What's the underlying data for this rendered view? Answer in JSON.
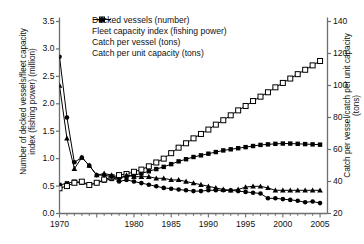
{
  "chart_data": {
    "type": "line",
    "title": "",
    "subtitle": "",
    "xlabel": "",
    "ylabel": "Number of decked vessels/fleet capacity\nindex (fishing power) (million)",
    "ylabel_right": "Catch per vessel/catch per unit capacity\n(tons)",
    "xlim": [
      1970,
      2006
    ],
    "ylim": [
      0.0,
      3.5
    ],
    "ylim_right": [
      20,
      140
    ],
    "grid": false,
    "legend_position": "top-left",
    "xticks": [
      1970,
      1975,
      1980,
      1985,
      1990,
      1995,
      2000,
      2005
    ],
    "xticklabels": [
      "1970",
      "",
      "1980",
      "1985",
      "1990",
      "1995",
      "2000",
      "2005"
    ],
    "yticks": [
      0.0,
      0.5,
      1.0,
      1.5,
      2.0,
      2.5,
      3.0,
      3.5
    ],
    "yticklabels": [
      "0.0",
      "0.5",
      "1.0",
      "1.5",
      "2.0",
      "2.5",
      "3.0",
      "3.5"
    ],
    "yticks_right": [
      20,
      40,
      60,
      80,
      100,
      120,
      140
    ],
    "yticklabels_right": [
      "20",
      "40",
      "60",
      "80",
      "100",
      "120",
      "140"
    ],
    "x": [
      1970,
      1971,
      1972,
      1973,
      1974,
      1975,
      1976,
      1977,
      1978,
      1979,
      1980,
      1981,
      1982,
      1983,
      1984,
      1985,
      1986,
      1987,
      1988,
      1989,
      1990,
      1991,
      1992,
      1993,
      1994,
      1995,
      1996,
      1997,
      1998,
      1999,
      2000,
      2001,
      2002,
      2003,
      2004,
      2005
    ],
    "series": [
      {
        "name": "Decked vessels (number)",
        "axis": "left",
        "marker": "filled-square",
        "values": [
          0.52,
          0.55,
          0.58,
          0.56,
          0.52,
          0.56,
          0.6,
          0.63,
          0.66,
          0.68,
          0.7,
          0.73,
          0.77,
          0.81,
          0.85,
          0.9,
          0.95,
          0.99,
          1.03,
          1.06,
          1.09,
          1.12,
          1.15,
          1.17,
          1.19,
          1.21,
          1.23,
          1.25,
          1.26,
          1.27,
          1.275,
          1.275,
          1.27,
          1.265,
          1.26,
          1.255
        ]
      },
      {
        "name": "Fleet capacity index (fishing power)",
        "axis": "left",
        "marker": "open-square",
        "values": [
          0.46,
          0.5,
          0.56,
          0.58,
          0.52,
          0.56,
          0.62,
          0.66,
          0.7,
          0.72,
          0.76,
          0.8,
          0.86,
          0.93,
          1.0,
          1.1,
          1.2,
          1.28,
          1.37,
          1.45,
          1.53,
          1.62,
          1.7,
          1.79,
          1.88,
          1.96,
          2.05,
          2.13,
          2.21,
          2.3,
          2.38,
          2.46,
          2.54,
          2.62,
          2.7,
          2.78
        ]
      },
      {
        "name": "Catch per vessel (tons)",
        "axis": "right",
        "marker": "filled-triangle",
        "values": [
          100.0,
          67.0,
          48.0,
          55.0,
          50.0,
          44.0,
          45.0,
          44.0,
          41.0,
          44.0,
          43.0,
          43.0,
          43.0,
          42.0,
          42.0,
          41.0,
          41.0,
          40.0,
          39.0,
          38.0,
          37.0,
          36.0,
          35.0,
          34.5,
          35.0,
          36.5,
          37.0,
          37.0,
          36.0,
          34.5,
          34.5,
          34.5,
          34.5,
          34.5,
          34.5,
          34.5
        ]
      },
      {
        "name": "Catch per unit capacity (tons)",
        "axis": "right",
        "marker": "filled-circle",
        "values": [
          118.0,
          80.0,
          52.0,
          55.0,
          50.0,
          44.0,
          44.0,
          43.0,
          40.0,
          41.0,
          40.0,
          39.0,
          38.0,
          37.0,
          36.0,
          35.5,
          35.0,
          34.5,
          34.0,
          34.0,
          34.5,
          34.5,
          34.5,
          34.5,
          34.0,
          33.5,
          33.0,
          32.5,
          29.5,
          29.5,
          29.0,
          28.5,
          28.0,
          27.0,
          27.5,
          26.5
        ]
      }
    ],
    "colors": {
      "line": "#000000",
      "axis": "#6e6e6e",
      "text": "#111111",
      "marker_fill": "#000000",
      "marker_open_fill": "#ffffff"
    }
  },
  "legend": {
    "items": [
      {
        "label": "Decked vessels (number)",
        "marker": "filled-square"
      },
      {
        "label": "Fleet capacity index (fishing power)",
        "marker": "open-square"
      },
      {
        "label": "Catch per vessel (tons)",
        "marker": "filled-triangle"
      },
      {
        "label": "Catch per unit capacity (tons)",
        "marker": "filled-circle"
      }
    ]
  }
}
